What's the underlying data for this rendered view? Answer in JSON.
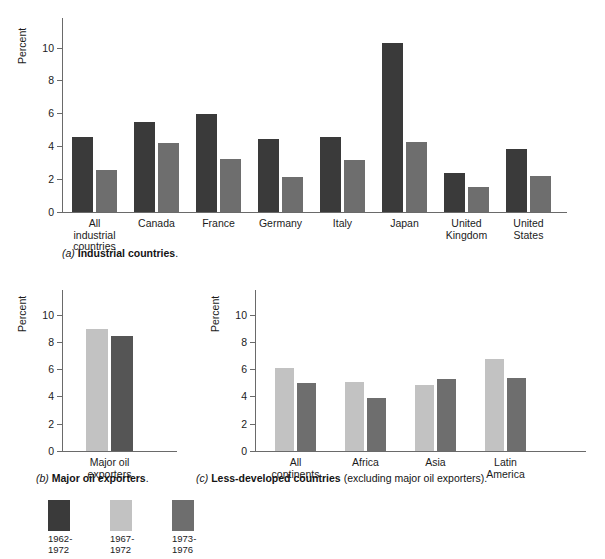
{
  "figure": {
    "y_axis_label": "Percent",
    "legend": {
      "items": [
        {
          "label": "1962-\n1972",
          "color": "#3a3a3a",
          "name": "legend-swatch-1962-1972"
        },
        {
          "label": "1967-\n1972",
          "color": "#c2c2c2",
          "name": "legend-swatch-1967-1972"
        },
        {
          "label": "1973-\n1976",
          "color": "#6e6e6e",
          "name": "legend-swatch-1973-1976"
        }
      ]
    },
    "captions": {
      "a": {
        "marker": "(a)",
        "bold": "Industrial countries",
        "tail": "."
      },
      "b": {
        "marker": "(b)",
        "bold": "Major oil exporters",
        "tail": "."
      },
      "c": {
        "marker": "(c)",
        "bold": "Less-developed countries",
        "tail": " (excluding major oil exporters)."
      }
    }
  },
  "chart_data": [
    {
      "id": "a",
      "type": "bar",
      "title": "(a) Industrial countries.",
      "xlabel": "",
      "ylabel": "Percent",
      "ylim": [
        0,
        11.8
      ],
      "yticks": [
        0,
        2,
        4,
        6,
        8,
        10
      ],
      "grid": false,
      "legend_position": "below-figure",
      "categories": [
        "All\nindustrial\ncountries",
        "Canada",
        "France",
        "Germany",
        "Italy",
        "Japan",
        "United\nKingdom",
        "United\nStates"
      ],
      "series": [
        {
          "name": "1962-1972",
          "color": "#3a3a3a",
          "values": [
            4.55,
            5.45,
            5.95,
            4.45,
            4.55,
            10.3,
            2.35,
            3.85
          ]
        },
        {
          "name": "1973-1976",
          "color": "#6e6e6e",
          "values": [
            2.55,
            4.2,
            3.25,
            2.1,
            3.15,
            4.25,
            1.5,
            2.2
          ]
        }
      ]
    },
    {
      "id": "b",
      "type": "bar",
      "title": "(b) Major oil exporters.",
      "xlabel": "",
      "ylabel": "Percent",
      "ylim": [
        0,
        11.8
      ],
      "yticks": [
        0,
        2,
        4,
        6,
        8,
        10
      ],
      "grid": false,
      "categories": [
        "Major oil\nexporters"
      ],
      "series": [
        {
          "name": "1967-1972",
          "color": "#c2c2c2",
          "values": [
            8.95
          ]
        },
        {
          "name": "1973-1976",
          "color": "#555555",
          "values": [
            8.4
          ]
        }
      ]
    },
    {
      "id": "c",
      "type": "bar",
      "title": "(c) Less-developed countries (excluding major oil exporters).",
      "xlabel": "",
      "ylabel": "Percent",
      "ylim": [
        0,
        11.8
      ],
      "yticks": [
        0,
        2,
        4,
        6,
        8,
        10
      ],
      "grid": false,
      "categories": [
        "All\ncontinents",
        "Africa",
        "Asia",
        "Latin\nAmerica"
      ],
      "series": [
        {
          "name": "1967-1972",
          "color": "#c2c2c2",
          "values": [
            6.05,
            5.05,
            4.85,
            6.75
          ]
        },
        {
          "name": "1973-1976",
          "color": "#6e6e6e",
          "values": [
            5.0,
            3.85,
            5.25,
            5.35
          ]
        }
      ]
    }
  ]
}
